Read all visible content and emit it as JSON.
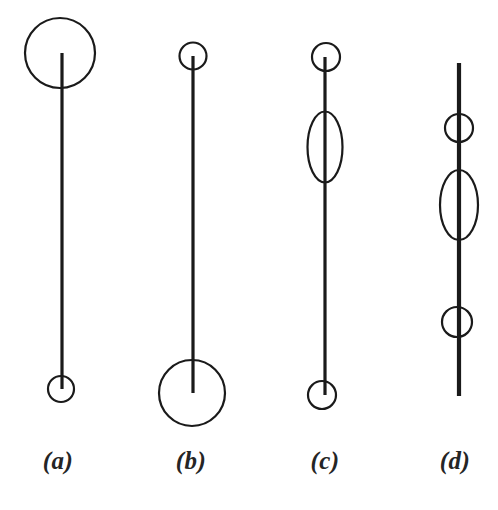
{
  "figure": {
    "background_color": "#ffffff",
    "stroke_color": "#1a1a1a",
    "width": 498,
    "height": 510,
    "caption_style": "italic-serif-parenthesized"
  },
  "panels": [
    {
      "id": "a",
      "label": "(a)",
      "description": "vertical line with a large circle at the top end and a small circle at the bottom end",
      "line": {
        "x": 62,
        "y_top": 53,
        "y_bottom": 389,
        "stroke_width": 3.2
      },
      "shapes": [
        {
          "kind": "circle",
          "role": "top-large-circle",
          "cx": 60,
          "cy": 53,
          "rx": 35,
          "ry": 35,
          "stroke_width": 2.2
        },
        {
          "kind": "circle",
          "role": "bottom-small-circle",
          "cx": 61,
          "cy": 389,
          "rx": 13,
          "ry": 13,
          "stroke_width": 2.2
        }
      ]
    },
    {
      "id": "b",
      "label": "(b)",
      "description": "vertical line with a small circle at the top end and a large circle at the bottom end",
      "line": {
        "x": 193,
        "y_top": 56,
        "y_bottom": 393,
        "stroke_width": 3.2
      },
      "shapes": [
        {
          "kind": "circle",
          "role": "top-small-circle",
          "cx": 193,
          "cy": 56,
          "rx": 13.5,
          "ry": 13.5,
          "stroke_width": 2.2
        },
        {
          "kind": "circle",
          "role": "bottom-large-circle",
          "cx": 192,
          "cy": 393,
          "rx": 33,
          "ry": 33,
          "stroke_width": 2.2
        }
      ]
    },
    {
      "id": "c",
      "label": "(c)",
      "description": "vertical line with a small circle at the top end, an elongated ellipse in the upper middle, and a small circle at the bottom end",
      "line": {
        "x": 325,
        "y_top": 57,
        "y_bottom": 395,
        "stroke_width": 3.2
      },
      "shapes": [
        {
          "kind": "circle",
          "role": "top-small-circle",
          "cx": 326,
          "cy": 57,
          "rx": 14,
          "ry": 14,
          "stroke_width": 2.2
        },
        {
          "kind": "ellipse",
          "role": "middle-ellipse",
          "cx": 325,
          "cy": 147,
          "rx": 17.5,
          "ry": 35.5,
          "stroke_width": 2.2
        },
        {
          "kind": "circle",
          "role": "bottom-small-circle",
          "cx": 322,
          "cy": 395,
          "rx": 14,
          "ry": 14,
          "stroke_width": 2.2
        }
      ]
    },
    {
      "id": "d",
      "label": "(d)",
      "description": "vertical line with no end circles, crossed by a small circle, an elongated ellipse and another small circle along its length",
      "line": {
        "x": 459,
        "y_top": 63,
        "y_bottom": 396,
        "stroke_width": 4.2
      },
      "shapes": [
        {
          "kind": "circle",
          "role": "upper-small-circle",
          "cx": 459,
          "cy": 128,
          "rx": 14,
          "ry": 14,
          "stroke_width": 2.2
        },
        {
          "kind": "ellipse",
          "role": "middle-ellipse",
          "cx": 459,
          "cy": 205,
          "rx": 19,
          "ry": 35,
          "stroke_width": 2.2
        },
        {
          "kind": "circle",
          "role": "lower-small-circle",
          "cx": 457,
          "cy": 322,
          "rx": 15,
          "ry": 15,
          "stroke_width": 2.2
        }
      ]
    }
  ],
  "chart_data": {
    "type": "diagram",
    "title": "",
    "xlabel": "",
    "ylabel": "",
    "legend": [],
    "annotations": [
      "(a)",
      "(b)",
      "(c)",
      "(d)"
    ]
  }
}
